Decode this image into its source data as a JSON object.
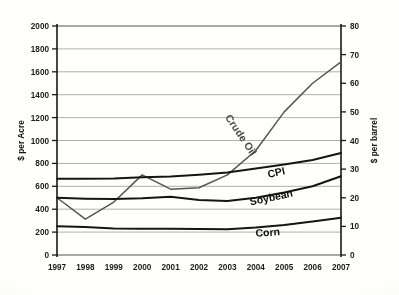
{
  "chart_data": {
    "type": "line",
    "title": "",
    "subtitle": "",
    "xlabel": "",
    "ylabel": "$ per Acre",
    "y2label": "$ per barrel",
    "categories": [
      "1997",
      "1998",
      "1999",
      "2000",
      "2001",
      "2002",
      "2003",
      "2004",
      "2005",
      "2006",
      "2007"
    ],
    "x_tick_labels": [
      "1997",
      "1998",
      "1999",
      "2000",
      "2001",
      "2002",
      "2003",
      "2004",
      "2005",
      "2006",
      "2007"
    ],
    "ylim": [
      0,
      2000
    ],
    "y_tick_labels": [
      "0",
      "200",
      "400",
      "600",
      "800",
      "1000",
      "1200",
      "1400",
      "1600",
      "1800",
      "2000"
    ],
    "y_ticks": [
      0,
      200,
      400,
      600,
      800,
      1000,
      1200,
      1400,
      1600,
      1800,
      2000
    ],
    "y2lim": [
      0,
      80
    ],
    "y2_tick_labels": [
      "0",
      "10",
      "20",
      "30",
      "40",
      "50",
      "60",
      "70",
      "80"
    ],
    "y2_ticks": [
      0,
      10,
      20,
      30,
      40,
      50,
      60,
      70,
      80
    ],
    "grid": true,
    "grid_axis": "y",
    "legend": "inline-labels",
    "legend_position": "on-plot",
    "series": [
      {
        "name": "Crude Oil",
        "label": "Crude Oil",
        "axis": "right",
        "units": "$ per barrel",
        "values": [
          20.0,
          12.5,
          18.5,
          28.0,
          23.0,
          23.5,
          28.0,
          36.5,
          50.0,
          60.0,
          67.5
        ]
      },
      {
        "name": "CPI",
        "label": "CPI",
        "axis": "left",
        "units": "$ per Acre",
        "values": [
          665,
          665,
          668,
          678,
          685,
          700,
          720,
          755,
          790,
          830,
          890
        ]
      },
      {
        "name": "Soybean",
        "label": "Soybean",
        "axis": "left",
        "units": "$ per Acre",
        "values": [
          500,
          492,
          488,
          495,
          508,
          480,
          472,
          500,
          545,
          600,
          688
        ]
      },
      {
        "name": "Corn",
        "label": "Corn",
        "axis": "left",
        "units": "$ per Acre",
        "values": [
          252,
          245,
          232,
          230,
          230,
          228,
          225,
          240,
          262,
          292,
          325
        ]
      }
    ],
    "colors": {
      "line": "#171717",
      "crude_oil_line": "#555555",
      "gridline": "#9a9a9a",
      "axis": "#1a1a1a",
      "background": "#fdfdfb"
    },
    "annotations": [
      {
        "text": "Crude Oil",
        "series": "Crude Oil",
        "rotated": true
      },
      {
        "text": "CPI",
        "series": "CPI",
        "rotated": true
      },
      {
        "text": "Soybean",
        "series": "Soybean",
        "rotated": true
      },
      {
        "text": "Corn",
        "series": "Corn",
        "rotated": false
      }
    ]
  }
}
